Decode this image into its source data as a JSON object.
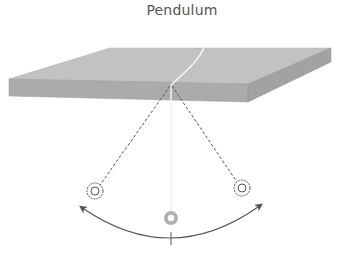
{
  "diagram": {
    "title": "Pendulum",
    "elements": {
      "support": "horizontal slab (ceiling/table)",
      "pivot": "string attachment point",
      "string": "pendulum string",
      "bob_left": "extreme left position (dashed)",
      "bob_right": "extreme right position (dashed)",
      "bob_center": "equilibrium position",
      "swing_arc": "double-headed arc showing oscillation",
      "equilibrium_tick": "vertical tick at lowest point"
    },
    "colors": {
      "slab_top": "#bdbdbd",
      "slab_front": "#a9a9a9",
      "slab_side": "#9e9e9e",
      "dashed_line": "#555555",
      "arc": "#555555",
      "bob_center": "#b0b0b0",
      "title": "#555555"
    }
  }
}
